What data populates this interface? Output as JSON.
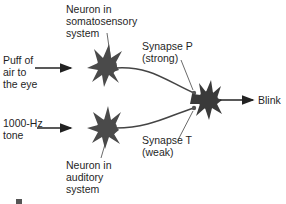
{
  "diagram": {
    "type": "neural-circuit",
    "colors": {
      "neuron": "#4a4a4a",
      "line": "#222222",
      "text": "#1f1f1f"
    },
    "inputs": {
      "puff": {
        "line1": "Puff of",
        "line2": "air to",
        "line3": "the eye"
      },
      "tone": {
        "line1": "1000-Hz",
        "line2": "tone"
      }
    },
    "neurons": {
      "somatosensory": {
        "line1": "Neuron in",
        "line2": "somatosensory",
        "line3": "system"
      },
      "auditory": {
        "line1": "Neuron in",
        "line2": "auditory",
        "line3": "system"
      }
    },
    "synapses": {
      "p": {
        "line1": "Synapse P",
        "line2": "(strong)"
      },
      "t": {
        "line1": "Synapse T",
        "line2": "(weak)"
      }
    },
    "output": {
      "label": "Blink"
    }
  }
}
